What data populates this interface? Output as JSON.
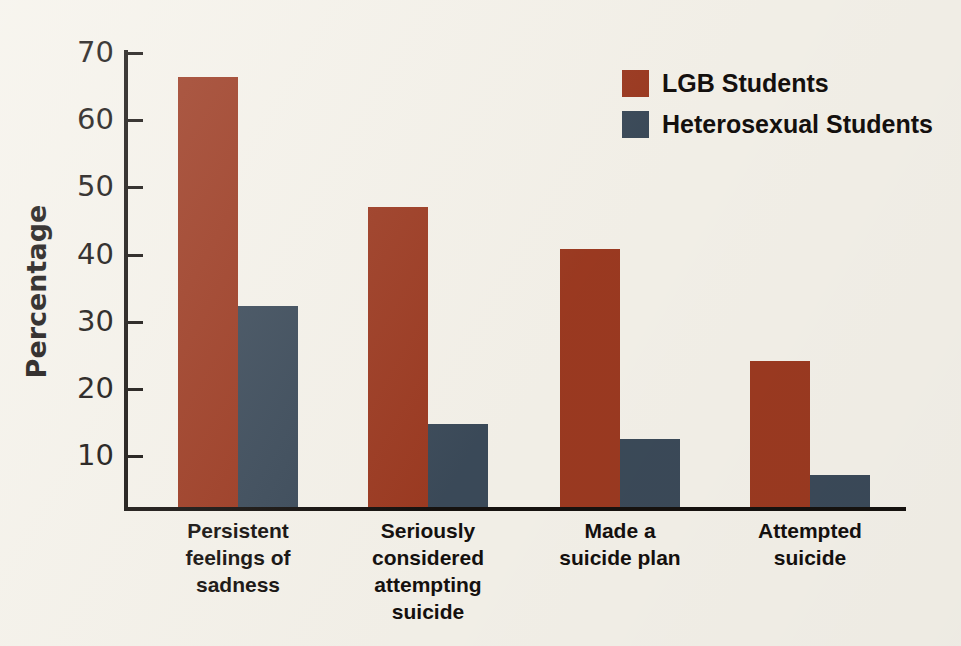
{
  "chart_data": {
    "type": "bar",
    "title": "",
    "xlabel": "",
    "ylabel": "Percentage",
    "ylim": [
      0,
      72
    ],
    "grid": false,
    "legend_position": "top-right",
    "categories": [
      "Persistent\nfeelings of\nsadness",
      "Seriously\nconsidered\nattempting\nsuicide",
      "Made a\nsuicide plan",
      "Attempted\nsuicide"
    ],
    "category_lines": [
      [
        "Persistent",
        "feelings of",
        "sadness"
      ],
      [
        "Seriously",
        "considered",
        "attempting",
        "suicide"
      ],
      [
        "Made a",
        "suicide plan"
      ],
      [
        "Attempted",
        "suicide"
      ]
    ],
    "series": [
      {
        "name": "LGB Students",
        "color": "#9c3a21",
        "values": [
          66.5,
          47.0,
          40.8,
          24.2
        ]
      },
      {
        "name": "Heterosexual Students",
        "color": "#3b4a59",
        "values": [
          32.4,
          14.8,
          12.6,
          7.2
        ]
      }
    ],
    "yticks": [
      70,
      60,
      50,
      40,
      30,
      20,
      10
    ],
    "ytick_labels": [
      "70",
      "60",
      "50",
      "40",
      "30",
      "20",
      "10"
    ]
  },
  "axis": {
    "y_title": "Percentage"
  },
  "legend": {
    "items": [
      {
        "label": "LGB Students"
      },
      {
        "label": "Heterosexual Students"
      }
    ]
  },
  "colors": {
    "background": "#f5f2ea",
    "axis": "#16120f",
    "text": "#14100e",
    "lgb": "#9c3a21",
    "heterosexual": "#3b4a59"
  }
}
